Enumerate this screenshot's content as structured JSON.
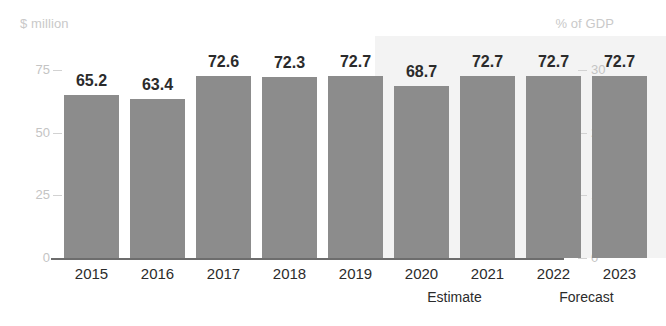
{
  "chart_data": {
    "type": "bar",
    "title": "",
    "subtitle": "",
    "xlabel": "",
    "ylabel": "$ million",
    "ylabel_right": "% of GDP",
    "categories": [
      "2015",
      "2016",
      "2017",
      "2018",
      "2019",
      "2020",
      "2021",
      "2022",
      "2023"
    ],
    "values": [
      65.2,
      63.4,
      72.6,
      72.3,
      72.7,
      68.7,
      72.7,
      72.7,
      72.7
    ],
    "value_labels": [
      "65.2",
      "63.4",
      "72.6",
      "72.3",
      "72.7",
      "68.7",
      "72.7",
      "72.7",
      "72.7"
    ],
    "ylim": [
      0,
      75
    ],
    "yticks": [
      0,
      25,
      50,
      75
    ],
    "ytick_labels": [
      "0",
      "25",
      "50",
      "75"
    ],
    "ylim_right": [
      0,
      30
    ],
    "yticks_right": [
      0,
      10,
      20,
      30
    ],
    "ytick_labels_right": [
      "0",
      "10",
      "20",
      "30"
    ],
    "grid": false,
    "legend": "none",
    "bar_color": "#8c8c8c",
    "shaded_band_color": "#f3f3f3",
    "axis_label_color": "#c4c4c4",
    "axis_line_color": "#6d6d6d",
    "value_label_color": "#2b2b2b",
    "annotations": [
      {
        "text": "Estimate",
        "spans": [
          "2020",
          "2021"
        ]
      },
      {
        "text": "Forecast",
        "spans": [
          "2022",
          "2023"
        ]
      }
    ],
    "shaded_region": {
      "from_category": "2020",
      "to_category": "2023"
    }
  }
}
